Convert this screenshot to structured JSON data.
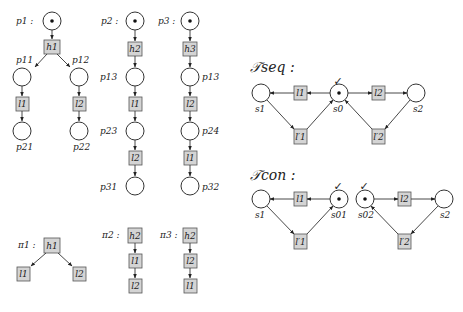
{
  "processes": {
    "p1": {
      "label": "p1 :",
      "h": "h1",
      "places": [
        "p11",
        "p12",
        "p21",
        "p22"
      ],
      "l_left": "l1",
      "l_right": "l2"
    },
    "p2": {
      "label": "p2 :",
      "h": "h2",
      "place1": "p13",
      "t1": "l1",
      "place2": "p23",
      "t2": "l2",
      "place3": "p31"
    },
    "p3": {
      "label": "p3 :",
      "h": "h3",
      "place1": "p13",
      "t1": "l2",
      "place2": "p24",
      "t2": "l1",
      "place3": "p32"
    }
  },
  "paths": {
    "pi1": {
      "label": "π1 :",
      "root": "h1",
      "left": "l1",
      "right": "l2"
    },
    "pi2": {
      "label": "π2 :",
      "items": [
        "h2",
        "l1",
        "l2"
      ]
    },
    "pi3": {
      "label": "π3 :",
      "items": [
        "h2",
        "l2",
        "l1"
      ]
    }
  },
  "tseq": {
    "title": "𝒯seq :",
    "places": {
      "s1": "s1",
      "s0": "s0",
      "s2": "s2"
    },
    "transitions": {
      "l1": "l1",
      "l2": "l2",
      "l1p": "l′1",
      "l2p": "l′2"
    },
    "check": "✓"
  },
  "tcon": {
    "title": "𝒯con :",
    "places": {
      "s1": "s1",
      "s01": "s01",
      "s02": "s02",
      "s2": "s2"
    },
    "transitions": {
      "l1": "l1",
      "l2": "l2",
      "l1p": "l′1",
      "l2p": "l′2"
    },
    "check": "✓"
  }
}
